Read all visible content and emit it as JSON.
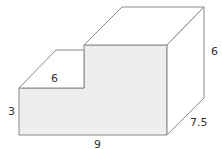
{
  "diagram": {
    "type": "3d-step-prism",
    "face_fill": "#eeeeee",
    "edge_color": "#888888",
    "labels": {
      "top_step_width": "6",
      "left_height": "3",
      "bottom_width": "9",
      "right_height": "6",
      "depth": "7.5"
    }
  }
}
